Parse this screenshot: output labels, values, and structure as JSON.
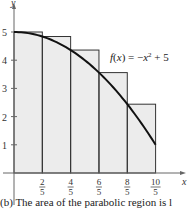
{
  "chart_data": {
    "type": "area",
    "title": "",
    "function_label": "f(x) = -x^2 + 5",
    "xlabel": "x",
    "ylabel": "y",
    "xlim": [
      0,
      2
    ],
    "ylim": [
      0,
      5
    ],
    "x_ticks": [
      "2/5",
      "4/5",
      "6/5",
      "8/5",
      "10/5"
    ],
    "x_tick_values": [
      0.4,
      0.8,
      1.2,
      1.6,
      2.0
    ],
    "y_ticks": [
      1,
      2,
      3,
      4,
      5
    ],
    "grid": false,
    "series": [
      {
        "name": "f(x) = -x^2 + 5",
        "kind": "curve",
        "x": [
          0,
          0.4,
          0.8,
          1.2,
          1.6,
          2.0
        ],
        "values": [
          5,
          4.84,
          4.36,
          3.56,
          2.44,
          1
        ]
      },
      {
        "name": "upper rectangles (left endpoints)",
        "kind": "rectangles",
        "x_left": [
          0,
          0.4,
          0.8,
          1.2,
          1.6
        ],
        "width": 0.4,
        "values": [
          5,
          4.84,
          4.36,
          3.56,
          2.44
        ]
      }
    ]
  },
  "labels": {
    "function": "f(x) = −x² + 5",
    "x_axis": "x",
    "y_axis": "y",
    "caption": "(b) The area of the parabolic region is l"
  },
  "colors": {
    "fill": "#ececec",
    "curve": "#111111",
    "rect_stroke": "#333333",
    "axis": "#555555"
  }
}
